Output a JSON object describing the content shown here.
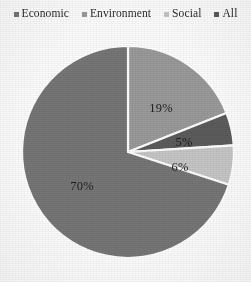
{
  "legend": {
    "position": "top",
    "items": [
      {
        "label": "Economic",
        "marker": "square-marker-icon",
        "color": "#767676"
      },
      {
        "label": "Environment",
        "marker": "square-marker-icon",
        "color": "#9a9a9a"
      },
      {
        "label": "Social",
        "marker": "square-marker-icon",
        "color": "#c6c6c6"
      },
      {
        "label": "All",
        "marker": "square-marker-icon",
        "color": "#5c5c5c"
      }
    ]
  },
  "chart_data": {
    "type": "pie",
    "title": "",
    "subtitle": "",
    "xlabel": "",
    "ylabel": "",
    "grid": false,
    "legend_position": "top",
    "start_angle_deg": 0,
    "direction": "clockwise",
    "center": {
      "x": 128,
      "y": 152
    },
    "radius": 106,
    "categories": [
      "Economic",
      "Environment",
      "Social",
      "All"
    ],
    "values": [
      70,
      19,
      5,
      6
    ],
    "slices": [
      {
        "name": "Environment",
        "value": 19,
        "label": "19%",
        "color": "#9a9a9a",
        "start_deg": 0,
        "end_deg": 68.4,
        "label_x": 161,
        "label_y": 108
      },
      {
        "name": "All",
        "value": 5,
        "label": "5%",
        "color": "#5c5c5c",
        "start_deg": 68.4,
        "end_deg": 86.4,
        "label_x": 184,
        "label_y": 142
      },
      {
        "name": "Social",
        "value": 6,
        "label": "6%",
        "color": "#c6c6c6",
        "start_deg": 86.4,
        "end_deg": 108.0,
        "label_x": 180,
        "label_y": 167
      },
      {
        "name": "Economic",
        "value": 70,
        "label": "70%",
        "color": "#767676",
        "start_deg": 108.0,
        "end_deg": 360.0,
        "label_x": 82,
        "label_y": 186
      }
    ],
    "separator_color": "#ffffff",
    "separator_width": 2.2,
    "label_color": "#1f1f1f",
    "background": "#fdfdfd"
  }
}
